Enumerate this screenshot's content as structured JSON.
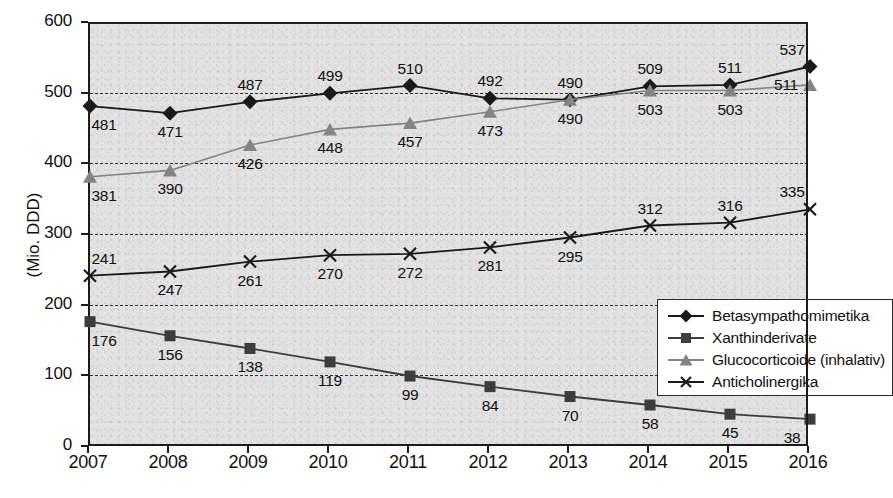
{
  "chart_data": {
    "type": "line",
    "title": "",
    "xlabel": "",
    "ylabel": "(Mio. DDD)",
    "categories": [
      "2007",
      "2008",
      "2009",
      "2010",
      "2011",
      "2012",
      "2013",
      "2014",
      "2015",
      "2016"
    ],
    "ylim": [
      0,
      600
    ],
    "yticks": [
      0,
      100,
      200,
      300,
      400,
      500,
      600
    ],
    "grid": true,
    "legend_position": "inside-right-middle",
    "series": [
      {
        "name": "Betasympathomimetika",
        "marker": "diamond",
        "color": "#1a1a1a",
        "values": [
          481,
          471,
          487,
          499,
          510,
          492,
          490,
          509,
          511,
          537
        ]
      },
      {
        "name": "Xanthinderivate",
        "marker": "square",
        "color": "#3d3d3d",
        "values": [
          176,
          156,
          138,
          119,
          99,
          84,
          70,
          58,
          45,
          38
        ]
      },
      {
        "name": "Glucocorticoide (inhalativ)",
        "marker": "triangle",
        "color": "#848484",
        "values": [
          381,
          390,
          426,
          448,
          457,
          473,
          490,
          503,
          503,
          511
        ]
      },
      {
        "name": "Anticholinergika",
        "marker": "cross",
        "color": "#1a1a1a",
        "values": [
          241,
          247,
          261,
          270,
          272,
          281,
          295,
          312,
          316,
          335
        ]
      }
    ]
  },
  "axis": {
    "y_title": "(Mio. DDD)",
    "y_labels": [
      "600",
      "500",
      "400",
      "300",
      "200",
      "100",
      "0"
    ],
    "x_labels": [
      "2007",
      "2008",
      "2009",
      "2010",
      "2011",
      "2012",
      "2013",
      "2014",
      "2015",
      "2016"
    ]
  },
  "legend": {
    "items": [
      {
        "label": "Betasympathomimetika",
        "marker": "diamond-icon"
      },
      {
        "label": "Xanthinderivate",
        "marker": "square-icon"
      },
      {
        "label": "Glucocorticoide (inhalativ)",
        "marker": "triangle-icon"
      },
      {
        "label": "Anticholinergika",
        "marker": "cross-icon"
      }
    ]
  },
  "colors": {
    "plot_background": "#e2e2e2",
    "axis": "#1c1c1c",
    "grid": "#303030",
    "series_black": "#1a1a1a",
    "series_dark_gray": "#3d3d3d",
    "series_gray": "#848484",
    "legend_background": "#ffffff"
  },
  "point_labels": {
    "betasympathomimetika": [
      "481",
      "471",
      "487",
      "499",
      "510",
      "492",
      "490",
      "509",
      "511",
      "537"
    ],
    "xanthinderivate": [
      "176",
      "156",
      "138",
      "119",
      "99",
      "84",
      "70",
      "58",
      "45",
      "38"
    ],
    "glucocorticoide": [
      "381",
      "390",
      "426",
      "448",
      "457",
      "473",
      "490",
      "503",
      "503",
      "511"
    ],
    "anticholinergika": [
      "241",
      "247",
      "261",
      "270",
      "272",
      "281",
      "295",
      "312",
      "316",
      "335"
    ]
  }
}
